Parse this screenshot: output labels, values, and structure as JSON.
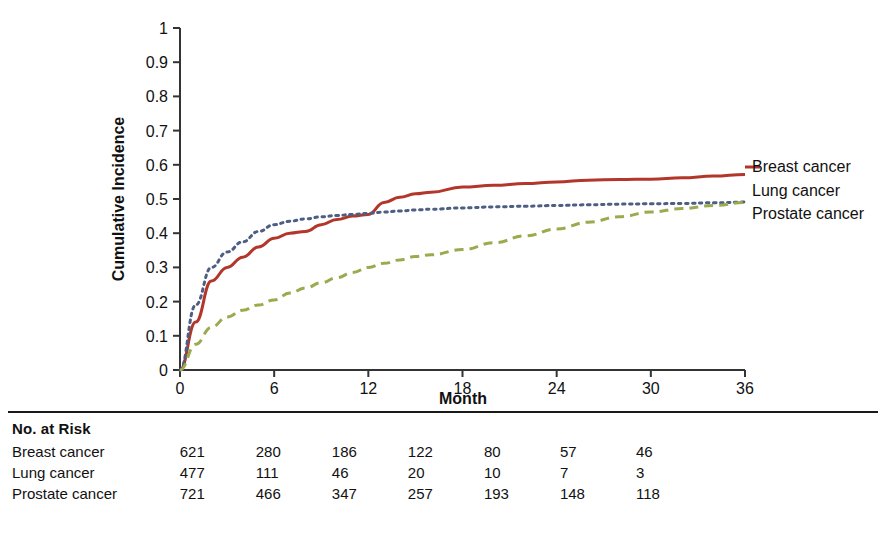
{
  "chart_data": {
    "type": "line",
    "title": "",
    "xlabel": "Month",
    "ylabel": "Cumulative Incidence",
    "xlim": [
      0,
      36
    ],
    "ylim": [
      0,
      1
    ],
    "xticks": [
      "0",
      "6",
      "12",
      "18",
      "24",
      "30",
      "36"
    ],
    "yticks": [
      "0",
      "0.1",
      "0.2",
      "0.3",
      "0.4",
      "0.5",
      "0.6",
      "0.7",
      "0.8",
      "0.9",
      "1"
    ],
    "grid": false,
    "legend_position": "right",
    "x": [
      0,
      1,
      2,
      3,
      4,
      5,
      6,
      7,
      8,
      9,
      10,
      11,
      12,
      13,
      14,
      15,
      16,
      18,
      20,
      22,
      24,
      26,
      28,
      30,
      32,
      34,
      36
    ],
    "series": [
      {
        "name": "Breast cancer",
        "color": "#b2372a",
        "style": "solid",
        "values": [
          0,
          0.14,
          0.26,
          0.3,
          0.33,
          0.36,
          0.385,
          0.4,
          0.405,
          0.425,
          0.44,
          0.45,
          0.455,
          0.49,
          0.505,
          0.515,
          0.52,
          0.535,
          0.54,
          0.545,
          0.55,
          0.555,
          0.557,
          0.558,
          0.562,
          0.567,
          0.572
        ]
      },
      {
        "name": "Lung cancer",
        "color": "#4e5e82",
        "style": "dotted",
        "values": [
          0,
          0.19,
          0.3,
          0.345,
          0.375,
          0.405,
          0.425,
          0.435,
          0.442,
          0.448,
          0.452,
          0.455,
          0.458,
          0.462,
          0.465,
          0.468,
          0.47,
          0.474,
          0.477,
          0.479,
          0.481,
          0.483,
          0.485,
          0.486,
          0.487,
          0.489,
          0.491
        ]
      },
      {
        "name": "Prostate cancer",
        "color": "#9aab4e",
        "style": "dashed",
        "values": [
          0,
          0.075,
          0.125,
          0.155,
          0.175,
          0.19,
          0.205,
          0.225,
          0.24,
          0.255,
          0.27,
          0.285,
          0.3,
          0.312,
          0.322,
          0.332,
          0.337,
          0.352,
          0.372,
          0.392,
          0.412,
          0.432,
          0.448,
          0.462,
          0.472,
          0.481,
          0.49
        ]
      }
    ]
  },
  "legend": {
    "items": [
      {
        "label": "Breast cancer"
      },
      {
        "label": "Lung cancer"
      },
      {
        "label": "Prostate cancer"
      }
    ]
  },
  "risk_table": {
    "title": "No. at Risk",
    "rows": [
      {
        "label": "Breast cancer",
        "values": [
          "621",
          "280",
          "186",
          "122",
          "80",
          "57",
          "46"
        ]
      },
      {
        "label": "Lung cancer",
        "values": [
          "477",
          "111",
          "46",
          "20",
          "10",
          "7",
          "3"
        ]
      },
      {
        "label": "Prostate cancer",
        "values": [
          "721",
          "466",
          "347",
          "257",
          "193",
          "148",
          "118"
        ]
      }
    ]
  }
}
